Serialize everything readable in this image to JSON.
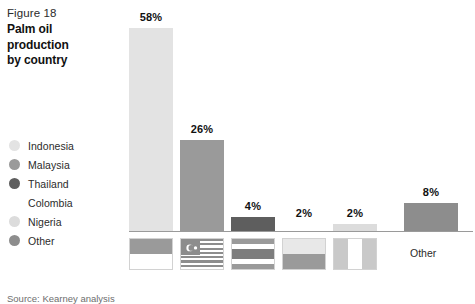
{
  "figure": {
    "number": "Figure 18",
    "title_line1": "Palm oil",
    "title_line2": "production",
    "title_line3": "by country",
    "source": "Source: Kearney analysis"
  },
  "legend": {
    "items": [
      {
        "label": "Indonesia",
        "color": "#e3e3e3"
      },
      {
        "label": "Malaysia",
        "color": "#9a9a9a"
      },
      {
        "label": "Thailand",
        "color": "#5e5e5e"
      },
      {
        "label": "Colombia",
        "color": "#ffffff"
      },
      {
        "label": "Nigeria",
        "color": "#dcdcdc"
      },
      {
        "label": "Other",
        "color": "#8d8d8d"
      }
    ]
  },
  "axis": {
    "other_label": "Other",
    "baseline_color": "#9a9a9a"
  },
  "chart_data": {
    "type": "bar",
    "title": "Palm oil production by country",
    "categories": [
      "Indonesia",
      "Malaysia",
      "Thailand",
      "Colombia",
      "Nigeria",
      "Other"
    ],
    "values": [
      58,
      26,
      4,
      2,
      2,
      8
    ],
    "value_labels": [
      "58%",
      "26%",
      "4%",
      "2%",
      "2%",
      "8%"
    ],
    "colors": [
      "#e3e3e3",
      "#9a9a9a",
      "#5e5e5e",
      "#ffffff",
      "#dcdcdc",
      "#8d8d8d"
    ],
    "unit": "%",
    "xlabel": "",
    "ylabel": "",
    "ylim": [
      0,
      58
    ],
    "grid": false,
    "legend_position": "left",
    "x_tick_style": "country-flags",
    "source": "Source: Kearney analysis"
  },
  "flags": {
    "indonesia": {
      "name": "indonesia-flag",
      "top": "#9a9a9a",
      "bottom": "#ffffff"
    },
    "malaysia": {
      "name": "malaysia-flag",
      "stripe_dark": "#8d8d8d",
      "stripe_light": "#ffffff",
      "canton": "#8d8d8d"
    },
    "thailand": {
      "name": "thailand-flag",
      "outer": "#9a9a9a",
      "stripe": "#ffffff",
      "center": "#7d7d7d"
    },
    "colombia": {
      "name": "colombia-flag",
      "top": "#e8e8e8",
      "bottom": "#9a9a9a"
    },
    "nigeria": {
      "name": "nigeria-flag",
      "side": "#c9c9c9",
      "center": "#ffffff"
    }
  }
}
